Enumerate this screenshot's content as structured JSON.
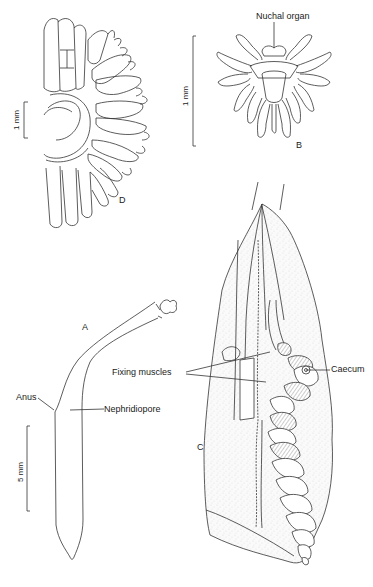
{
  "figure": {
    "panels": [
      {
        "id": "A",
        "letter": "A",
        "description": "Whole animal, lateral view"
      },
      {
        "id": "B",
        "letter": "B",
        "description": "Anterior end with tentacles, nuchal organ"
      },
      {
        "id": "C",
        "letter": "C",
        "description": "Dissected trunk showing gut coil"
      },
      {
        "id": "D",
        "letter": "D",
        "description": "Tentacular crown, anterior view"
      }
    ],
    "labels": {
      "nuchal_organ": "Nuchal organ",
      "fixing_muscles": "Fixing muscles",
      "caecum": "Caecum",
      "anus": "Anus",
      "nephridiopore": "Nephridiopore"
    },
    "scale_bars": {
      "d": "1 mm",
      "b": "1 mm",
      "a": "5 mm"
    }
  }
}
